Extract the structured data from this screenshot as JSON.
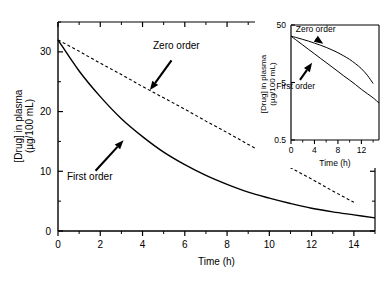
{
  "figure": {
    "name": "drug-elimination-kinetics-figure",
    "background": "#ffffff",
    "line_color": "#000000"
  },
  "chart_data": [
    {
      "id": "main",
      "type": "line",
      "title": "",
      "xlabel": "Time (h)",
      "ylabel": "[Drug] in plasma (µg/100 mL)",
      "ylabel_line1": "[Drug] in plasma",
      "ylabel_line2": "(µg/100 mL)",
      "xlim": [
        0,
        15
      ],
      "ylim": [
        0,
        35
      ],
      "yscale": "linear",
      "xscale": "linear",
      "grid": false,
      "legend": "none",
      "xticks": [
        0,
        2,
        4,
        6,
        8,
        10,
        12,
        14
      ],
      "xticklabels": [
        "0",
        "2",
        "4",
        "6",
        "8",
        "10",
        "12",
        "14"
      ],
      "xminor": [
        1,
        3,
        5,
        7,
        9,
        11,
        13,
        15
      ],
      "yticks": [
        0,
        10,
        20,
        30
      ],
      "yticklabels": [
        "0",
        "10",
        "20",
        "30"
      ],
      "yminor": [
        5,
        15,
        25,
        35
      ],
      "series": [
        {
          "name": "Zero order",
          "style": "dashed",
          "x": [
            0,
            1,
            2,
            3,
            4,
            5,
            6,
            7,
            8,
            9,
            10,
            11,
            12,
            13,
            14
          ],
          "values": [
            32.0,
            30.1,
            28.1,
            26.2,
            24.2,
            22.3,
            20.4,
            18.4,
            16.5,
            14.5,
            12.6,
            10.6,
            8.7,
            6.7,
            4.8
          ]
        },
        {
          "name": "First order",
          "style": "solid",
          "x": [
            0,
            1,
            2,
            3,
            4,
            5,
            6,
            7,
            8,
            9,
            10,
            11,
            12,
            13,
            14,
            15
          ],
          "values": [
            32.0,
            26.8,
            22.5,
            18.8,
            15.8,
            13.2,
            11.1,
            9.3,
            7.8,
            6.5,
            5.5,
            4.6,
            3.8,
            3.2,
            2.7,
            2.2
          ]
        }
      ],
      "annotations": [
        {
          "text": "Zero order",
          "x_text": 5.6,
          "y_text": 30.5,
          "x_point": 4.35,
          "y_point": 23.6
        },
        {
          "text": "First order",
          "x_text": 1.5,
          "y_text": 8.6,
          "x_point": 3.1,
          "y_point": 15.2
        }
      ]
    },
    {
      "id": "inset",
      "type": "line",
      "title": "",
      "xlabel": "Time (h)",
      "ylabel": "[Drug] in plasma (µg/100 mL)",
      "ylabel_line1": "[Drug] in plasma",
      "ylabel_line2": "(µg/100 mL)",
      "xlim": [
        0,
        15
      ],
      "ylim": [
        0.5,
        50
      ],
      "yscale": "log",
      "xscale": "linear",
      "grid": false,
      "legend": "none",
      "xticks": [
        0,
        4,
        8,
        12
      ],
      "xticklabels": [
        "0",
        "4",
        "8",
        "12"
      ],
      "xminor": [
        2,
        6,
        10,
        14
      ],
      "yticks": [
        0.5,
        5,
        50
      ],
      "yticklabels": [
        "0.5",
        "5",
        "50"
      ],
      "series": [
        {
          "name": "Zero order",
          "style": "solid",
          "x": [
            0,
            1,
            2,
            3,
            4,
            5,
            6,
            7,
            8,
            9,
            10,
            11,
            12,
            13,
            14
          ],
          "values": [
            32.0,
            30.1,
            28.1,
            26.2,
            24.2,
            22.3,
            20.4,
            18.4,
            16.5,
            14.5,
            12.6,
            10.6,
            8.7,
            6.7,
            4.8
          ]
        },
        {
          "name": "First order",
          "style": "solid",
          "x": [
            0,
            1,
            2,
            3,
            4,
            5,
            6,
            7,
            8,
            9,
            10,
            11,
            12,
            13,
            14,
            15
          ],
          "values": [
            32.0,
            26.8,
            22.5,
            18.8,
            15.8,
            13.2,
            11.1,
            9.3,
            7.8,
            6.5,
            5.5,
            4.6,
            3.8,
            3.2,
            2.7,
            2.2
          ]
        }
      ],
      "annotations": [
        {
          "text": "Zero order",
          "x_text": 4.2,
          "y_text": 38.0,
          "x_point": 5.5,
          "y_point": 23.5
        },
        {
          "text": "First order",
          "x_text": 0.8,
          "y_text": 3.9,
          "x_point": 3.6,
          "y_point": 11.0
        }
      ]
    }
  ]
}
